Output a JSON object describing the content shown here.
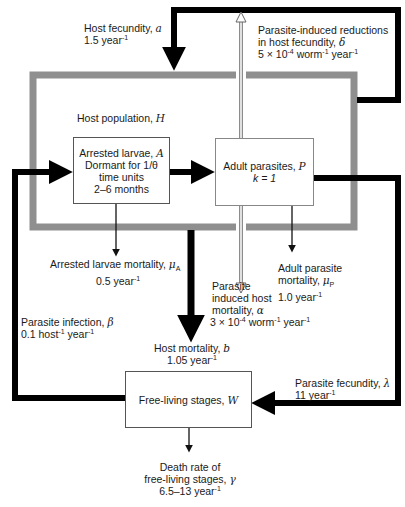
{
  "diagram": {
    "host_population": {
      "label": "Host population, ",
      "symbol": "H"
    },
    "arrested_larvae": {
      "line1": "Arrested larvae, ",
      "symbol": "A",
      "line2": "Dormant for 1/θ",
      "line3": "time units",
      "line4": "2–6 months"
    },
    "adult_parasites": {
      "line1": "Adult parasites, ",
      "symbol": "P",
      "line2": "k = 1"
    },
    "free_living": {
      "label": "Free-living stages, ",
      "symbol": "W"
    },
    "host_fecundity": {
      "line1": "Host fecundity, ",
      "symbol": "a",
      "value": "1.5 year",
      "exp": "-1"
    },
    "fecundity_reduction": {
      "line1": "Parasite-induced reductions",
      "line2": "in host fecundity, ",
      "symbol": "δ",
      "value_a": "5 × 10",
      "exp_a": "-4",
      "value_b": " worm",
      "exp_b": "-1",
      "value_c": " year",
      "exp_c": "-1"
    },
    "larvae_mortality": {
      "line1": "Arrested larvae mortality, ",
      "symbol": "μ",
      "sub": "A",
      "value": "0.5 year",
      "exp": "-1"
    },
    "host_induced_mortality": {
      "line1": "Parasite",
      "line2": "induced host",
      "line3": "mortality, ",
      "symbol": "α",
      "value_a": "3 × 10",
      "exp_a": "-4",
      "value_b": " worm",
      "exp_b": "-1",
      "value_c": " year",
      "exp_c": "-1"
    },
    "adult_mortality": {
      "line1": "Adult parasite",
      "line2": "mortality, ",
      "symbol": "μ",
      "sub": "P",
      "value": "1.0 year",
      "exp": "-1"
    },
    "parasite_infection": {
      "line1": "Parasite infection, ",
      "symbol": "β",
      "value_a": "0.1 host",
      "exp_a": "-1",
      "value_b": " year",
      "exp_b": "-1"
    },
    "host_mortality": {
      "line1": "Host mortality, ",
      "symbol": "b",
      "value": "1.05 year",
      "exp": "-1"
    },
    "parasite_fecundity": {
      "line1": "Parasite fecundity, ",
      "symbol": "λ",
      "value": "11 year",
      "exp": "-1"
    },
    "free_living_death": {
      "line1": "Death rate of",
      "line2": "free-living stages, ",
      "symbol": "γ",
      "value": "6.5–13 year",
      "exp": "-1"
    },
    "colors": {
      "host_border": "#8f8f8f",
      "flow": "#000000",
      "box_border": "#555555"
    }
  }
}
